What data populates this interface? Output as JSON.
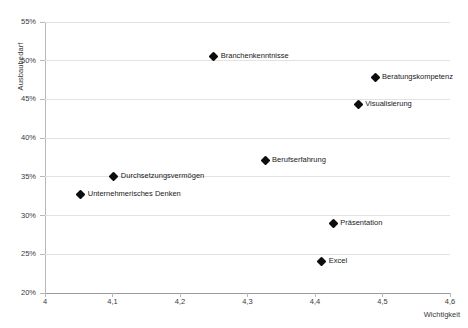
{
  "chart_data": {
    "type": "scatter",
    "title": "",
    "xlabel": "Wichtigkeit",
    "ylabel": "Ausbaubedarf",
    "xlim": [
      4,
      4.6
    ],
    "ylim": [
      20,
      55
    ],
    "xticks": [
      "4",
      "4,1",
      "4,2",
      "4,3",
      "4,4",
      "4,5",
      "4,6"
    ],
    "xtick_values": [
      4,
      4.1,
      4.2,
      4.3,
      4.4,
      4.5,
      4.6
    ],
    "yticks": [
      "20%",
      "25%",
      "30%",
      "35%",
      "40%",
      "45%",
      "50%",
      "55%"
    ],
    "ytick_values": [
      20,
      25,
      30,
      35,
      40,
      45,
      50,
      55
    ],
    "grid": "horizontal",
    "legend": "none",
    "marker": "diamond",
    "marker_color": "#0d0d0d",
    "points": [
      {
        "label": "Branchenkenntnisse",
        "x": 4.25,
        "y": 50.5
      },
      {
        "label": "Beratungskompetenz",
        "x": 4.489,
        "y": 47.8
      },
      {
        "label": "Visualisierung",
        "x": 4.464,
        "y": 44.4
      },
      {
        "label": "Berufserfahrung",
        "x": 4.326,
        "y": 37.1
      },
      {
        "label": "Durchsetzungsvermögen",
        "x": 4.102,
        "y": 35.0
      },
      {
        "label": "Unternehmerisches Denken",
        "x": 4.053,
        "y": 32.7
      },
      {
        "label": "Präsentation",
        "x": 4.427,
        "y": 29.0
      },
      {
        "label": "Excel",
        "x": 4.41,
        "y": 24.1
      }
    ]
  }
}
